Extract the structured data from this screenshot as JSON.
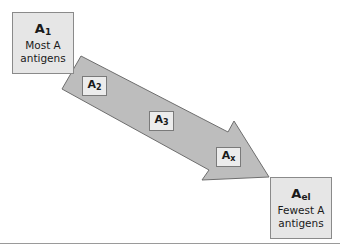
{
  "diagram": {
    "start": {
      "label": "A",
      "subscript": "1",
      "desc_line1": "Most A",
      "desc_line2": "antigens"
    },
    "end": {
      "label": "A",
      "subscript": "el",
      "desc_line1": "Fewest A",
      "desc_line2": "antigens"
    },
    "steps": [
      {
        "label": "A",
        "subscript": "2"
      },
      {
        "label": "A",
        "subscript": "3"
      },
      {
        "label": "A",
        "subscript": "x"
      }
    ],
    "colors": {
      "arrow_fill": "#bdbdbd",
      "arrow_stroke": "#6e6e6e",
      "box_fill": "#e6e6e6",
      "box_border": "#8a8a8a"
    }
  }
}
